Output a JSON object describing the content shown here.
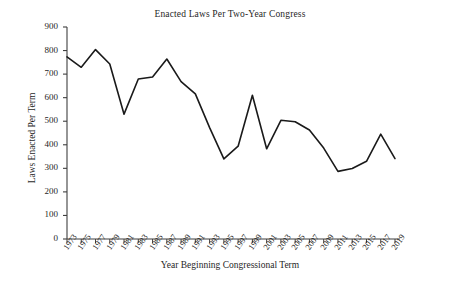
{
  "chart_data": {
    "type": "line",
    "title": "Enacted Laws Per Two-Year Congress",
    "xlabel": "Year Beginning Congressional Term",
    "ylabel": "Laws Enacted Per Term",
    "x": [
      1973,
      1975,
      1977,
      1979,
      1981,
      1983,
      1985,
      1987,
      1989,
      1991,
      1993,
      1995,
      1997,
      1999,
      2001,
      2003,
      2005,
      2007,
      2009,
      2011,
      2013,
      2015,
      2017,
      2019
    ],
    "categories": [
      "1973",
      "1975",
      "1977",
      "1979",
      "1981",
      "1983",
      "1985",
      "1987",
      "1989",
      "1991",
      "1993",
      "1995",
      "1997",
      "1999",
      "2001",
      "2003",
      "2005",
      "2007",
      "2009",
      "2011",
      "2013",
      "2015",
      "2017",
      "2019"
    ],
    "values": [
      773,
      729,
      804,
      743,
      530,
      679,
      688,
      764,
      668,
      616,
      473,
      340,
      394,
      610,
      383,
      504,
      498,
      463,
      386,
      287,
      299,
      330,
      445,
      341
    ],
    "series": [
      {
        "name": "Laws Enacted Per Term",
        "values": [
          773,
          729,
          804,
          743,
          530,
          679,
          688,
          764,
          668,
          616,
          473,
          340,
          394,
          610,
          383,
          504,
          498,
          463,
          386,
          287,
          299,
          330,
          445,
          341
        ]
      }
    ],
    "ylim": [
      0,
      900
    ],
    "yticks": [
      0,
      100,
      200,
      300,
      400,
      500,
      600,
      700,
      800,
      900
    ],
    "ytick_labels": [
      "0",
      "100",
      "200",
      "300",
      "400",
      "500",
      "600",
      "700",
      "800",
      "900"
    ],
    "grid": false,
    "legend": false,
    "legend_position": "none",
    "line_color": "#1a1a1a",
    "axis_color": "#444444",
    "background_color": "#ffffff",
    "xtick_rotation": -55
  }
}
